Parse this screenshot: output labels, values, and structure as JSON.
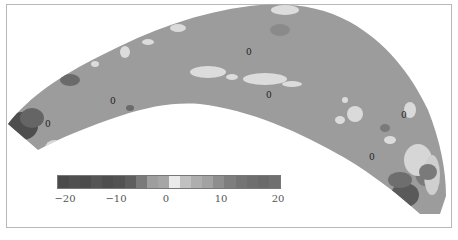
{
  "chart_data": {
    "type": "heatmap",
    "title": "",
    "colorbar": {
      "min": -20,
      "max": 20,
      "tick_labels": [
        "−20",
        "−10",
        "0",
        "10",
        "20"
      ],
      "tick_values": [
        -20,
        -10,
        0,
        10,
        20
      ],
      "segments": [
        "#4a4a4a",
        "#505050",
        "#4c4c4c",
        "#555555",
        "#4e4e4e",
        "#525252",
        "#5e5e5e",
        "#7a7a7a",
        "#9e9e9e",
        "#a6a6a6",
        "#eaeaea",
        "#c0c0c0",
        "#aeaeae",
        "#a2a2a2",
        "#8e8e8e",
        "#7e7e7e",
        "#747474",
        "#6e6e6e",
        "#6a6a6a",
        "#707070"
      ]
    },
    "contour_labels": [
      "0",
      "0",
      "0",
      "0",
      "0",
      "0"
    ],
    "base_fill": "#9c9c9c",
    "highlight_fill": "#dcdcdc",
    "dark_fill": "#4a4a4a"
  }
}
